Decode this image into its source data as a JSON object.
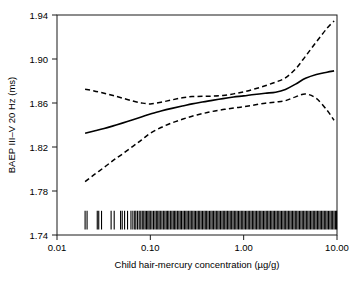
{
  "chart_data": {
    "type": "line",
    "title": "",
    "xlabel": "Child hair-mercury concentration (µg/g)",
    "ylabel": "BAEP III–V 20 Hz (ms)",
    "xscale": "log",
    "xlim": [
      0.01,
      10.0
    ],
    "ylim": [
      1.74,
      1.94
    ],
    "xticks": [
      0.01,
      0.1,
      1.0,
      10.0
    ],
    "xtick_labels": [
      "0.01",
      "0.10",
      "1.00",
      "10.00"
    ],
    "yticks": [
      1.74,
      1.78,
      1.82,
      1.86,
      1.9,
      1.94
    ],
    "ytick_labels": [
      "1.74",
      "1.78",
      "1.82",
      "1.86",
      "1.90",
      "1.94"
    ],
    "grid": false,
    "legend": "none",
    "frame": "box",
    "series": [
      {
        "name": "fitted",
        "style": "solid",
        "color": "#000000",
        "x": [
          0.02,
          0.025,
          0.032,
          0.04,
          0.05,
          0.065,
          0.08,
          0.1,
          0.13,
          0.17,
          0.22,
          0.28,
          0.36,
          0.46,
          0.6,
          0.78,
          1.0,
          1.3,
          1.7,
          2.2,
          2.8,
          3.6,
          4.6,
          6.0,
          7.8,
          9.3
        ],
        "y": [
          1.8325,
          1.8345,
          1.8368,
          1.8392,
          1.8417,
          1.8447,
          1.8472,
          1.8501,
          1.8527,
          1.8551,
          1.8572,
          1.8592,
          1.8609,
          1.8624,
          1.864,
          1.8654,
          1.8665,
          1.8678,
          1.8689,
          1.8698,
          1.8723,
          1.8772,
          1.8825,
          1.886,
          1.888,
          1.8892
        ]
      },
      {
        "name": "upper 95% confidence limit",
        "style": "dashed",
        "color": "#000000",
        "x": [
          0.02,
          0.025,
          0.032,
          0.04,
          0.05,
          0.065,
          0.08,
          0.1,
          0.13,
          0.17,
          0.22,
          0.28,
          0.36,
          0.46,
          0.6,
          0.78,
          1.0,
          1.3,
          1.7,
          2.2,
          2.8,
          3.6,
          4.6,
          6.0,
          7.8,
          9.3
        ],
        "y": [
          1.8725,
          1.871,
          1.8689,
          1.8668,
          1.8645,
          1.8618,
          1.8601,
          1.8592,
          1.8607,
          1.8628,
          1.8648,
          1.8658,
          1.8661,
          1.8663,
          1.8669,
          1.8683,
          1.8702,
          1.8727,
          1.8757,
          1.879,
          1.8828,
          1.891,
          1.9025,
          1.9155,
          1.9278,
          1.9345
        ]
      },
      {
        "name": "lower 95% confidence limit",
        "style": "dashed",
        "color": "#000000",
        "x": [
          0.02,
          0.025,
          0.032,
          0.04,
          0.05,
          0.065,
          0.08,
          0.1,
          0.13,
          0.17,
          0.22,
          0.28,
          0.36,
          0.46,
          0.6,
          0.78,
          1.0,
          1.3,
          1.7,
          2.2,
          2.8,
          3.6,
          4.6,
          6.0,
          7.8,
          9.3
        ],
        "y": [
          1.7885,
          1.7948,
          1.8015,
          1.8078,
          1.8135,
          1.8206,
          1.8262,
          1.8325,
          1.8377,
          1.8419,
          1.8452,
          1.848,
          1.8503,
          1.8523,
          1.854,
          1.8554,
          1.8566,
          1.8582,
          1.8598,
          1.8609,
          1.8621,
          1.8656,
          1.8682,
          1.8642,
          1.8535,
          1.8443
        ]
      }
    ],
    "rug": {
      "name": "observation rug",
      "axis": "x",
      "y_bottom": 1.745,
      "y_top": 1.762,
      "values": [
        0.02,
        0.021,
        0.027,
        0.028,
        0.03,
        0.038,
        0.041,
        0.048,
        0.05,
        0.053,
        0.057,
        0.062,
        0.065,
        0.068,
        0.07,
        0.073,
        0.076,
        0.079,
        0.082,
        0.085,
        0.088,
        0.091,
        0.094,
        0.097,
        0.1,
        0.104,
        0.108,
        0.112,
        0.116,
        0.12,
        0.124,
        0.128,
        0.133,
        0.138,
        0.143,
        0.148,
        0.153,
        0.158,
        0.164,
        0.17,
        0.176,
        0.182,
        0.188,
        0.195,
        0.202,
        0.209,
        0.216,
        0.224,
        0.232,
        0.24,
        0.248,
        0.257,
        0.266,
        0.275,
        0.285,
        0.295,
        0.305,
        0.316,
        0.327,
        0.338,
        0.35,
        0.362,
        0.375,
        0.388,
        0.401,
        0.415,
        0.43,
        0.445,
        0.46,
        0.476,
        0.493,
        0.51,
        0.528,
        0.546,
        0.565,
        0.585,
        0.605,
        0.626,
        0.648,
        0.67,
        0.694,
        0.718,
        0.743,
        0.769,
        0.795,
        0.823,
        0.852,
        0.881,
        0.912,
        0.944,
        0.977,
        1.011,
        1.046,
        1.082,
        1.12,
        1.159,
        1.199,
        1.241,
        1.284,
        1.329,
        1.375,
        1.423,
        1.472,
        1.524,
        1.576,
        1.631,
        1.688,
        1.747,
        1.807,
        1.87,
        1.935,
        2.002,
        2.072,
        2.144,
        2.218,
        2.295,
        2.375,
        2.457,
        2.543,
        2.631,
        2.722,
        2.817,
        2.915,
        3.016,
        3.121,
        3.229,
        3.341,
        3.457,
        3.577,
        3.701,
        3.829,
        3.962,
        4.099,
        4.242,
        4.389,
        4.541,
        4.699,
        4.862,
        5.03,
        5.204,
        5.385,
        5.572,
        5.765,
        5.965,
        6.172,
        6.386,
        6.607,
        6.836,
        7.074,
        7.319,
        7.573,
        7.836,
        8.107,
        8.389,
        8.68,
        8.981,
        9.293,
        9.615,
        9.9
      ]
    }
  },
  "axes": {
    "x_axis_name": "x-axis",
    "y_axis_name": "y-axis"
  }
}
